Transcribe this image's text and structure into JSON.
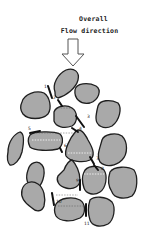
{
  "title": {
    "line1": "Overall",
    "line2": "Flow direction"
  },
  "arrow": {
    "direction": "down",
    "fill": "#ffffff",
    "stroke": "#555555"
  },
  "colors": {
    "grain_fill": "#a9a9a9",
    "grain_outline": "#1e1e1e",
    "background": "#ffffff"
  },
  "path_labels": [
    "1",
    "2",
    "3",
    "4",
    "5",
    "6",
    "7",
    "8",
    "9",
    "10",
    "11"
  ]
}
